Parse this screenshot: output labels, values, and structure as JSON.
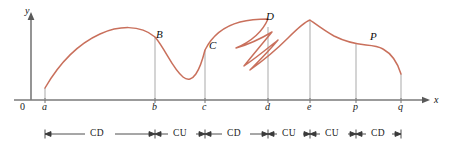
{
  "figure": {
    "curve_color": "#c9705c",
    "gridline_color": "#b4b4b4",
    "axis_color": "#6f6f6f",
    "annotation_color": "#333333"
  },
  "axes": {
    "y_label": "y",
    "x_label": "x",
    "origin_label": "0",
    "x_axis_y": 100,
    "y_axis_x": 31
  },
  "ticks": [
    {
      "label": "a",
      "x": 45
    },
    {
      "label": "b",
      "x": 155
    },
    {
      "label": "c",
      "x": 205
    },
    {
      "label": "d",
      "x": 268
    },
    {
      "label": "e",
      "x": 310
    },
    {
      "label": "p",
      "x": 356
    },
    {
      "label": "q",
      "x": 401
    }
  ],
  "points": [
    {
      "label": "B",
      "x": 158,
      "y": 36
    },
    {
      "label": "C",
      "x": 211,
      "y": 45
    },
    {
      "label": "D",
      "x": 268,
      "y": 19
    },
    {
      "label": "P",
      "x": 372,
      "y": 38
    }
  ],
  "concavity_segments": [
    {
      "label": "CD",
      "from": "a",
      "to": "b",
      "x_start": 45,
      "x_end": 155
    },
    {
      "label": "CU",
      "from": "b",
      "to": "c",
      "x_start": 155,
      "x_end": 205
    },
    {
      "label": "CD",
      "from": "c",
      "to": "d",
      "x_start": 205,
      "x_end": 268
    },
    {
      "label": "CU",
      "from": "d",
      "to": "e",
      "x_start": 268,
      "x_end": 310
    },
    {
      "label": "CU",
      "from": "e",
      "to": "p",
      "x_start": 310,
      "x_end": 356
    },
    {
      "label": "CD",
      "from": "p",
      "to": "q",
      "x_start": 356,
      "x_end": 401
    }
  ],
  "annotation_row_y": 134
}
